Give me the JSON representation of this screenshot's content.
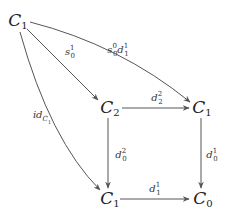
{
  "diagram": {
    "type": "commutative-diagram",
    "nodes": [
      {
        "id": "n_top",
        "base": "C",
        "sub": "1",
        "x": 18,
        "y": 21
      },
      {
        "id": "n_mid",
        "base": "C",
        "sub": "2",
        "x": 110,
        "y": 108
      },
      {
        "id": "n_right",
        "base": "C",
        "sub": "1",
        "x": 201,
        "y": 108
      },
      {
        "id": "n_bot",
        "base": "C",
        "sub": "1",
        "x": 108,
        "y": 199
      },
      {
        "id": "n_zero",
        "base": "C",
        "sub": "0",
        "x": 201,
        "y": 199
      }
    ],
    "edges": [
      {
        "from": "n_top",
        "to": "n_mid",
        "label": "s_0^1",
        "label_parts": {
          "base": "s",
          "sup": "1",
          "sub": "0"
        }
      },
      {
        "from": "n_top",
        "to": "n_right",
        "label": "s_0^0 d_1^1",
        "label_parts": {
          "base": "s",
          "sup": "0",
          "sub": "0",
          "base2": "d",
          "sup2": "1",
          "sub2": "1"
        }
      },
      {
        "from": "n_top",
        "to": "n_bot",
        "label": "id_{C_1}",
        "label_parts": {
          "base": "id",
          "sub": "C",
          "subsub": "1"
        }
      },
      {
        "from": "n_mid",
        "to": "n_right",
        "label": "d_2^2",
        "label_parts": {
          "base": "d",
          "sup": "2",
          "sub": "2"
        }
      },
      {
        "from": "n_mid",
        "to": "n_bot",
        "label": "d_0^2",
        "label_parts": {
          "base": "d",
          "sup": "2",
          "sub": "0"
        }
      },
      {
        "from": "n_right",
        "to": "n_zero",
        "label": "d_0^1",
        "label_parts": {
          "base": "d",
          "sup": "1",
          "sub": "0"
        }
      },
      {
        "from": "n_bot",
        "to": "n_zero",
        "label": "d_1^1",
        "label_parts": {
          "base": "d",
          "sup": "1",
          "sub": "1"
        }
      }
    ],
    "colors": {
      "stroke": "#555555",
      "text": "#222222",
      "background": "#ffffff"
    }
  }
}
